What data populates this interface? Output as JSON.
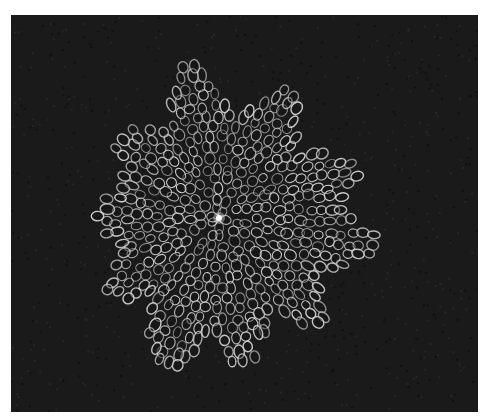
{
  "image": {
    "subject": "radial cellular colony (white cell outlines on dark background)",
    "caption": "",
    "frame_color": "#ffffff",
    "background_color": "#1a1a1a",
    "outline_color": "#d9d9d9",
    "center_highlight_color": "#ffffff",
    "panel": {
      "x": 11,
      "y": 15,
      "width": 467,
      "height": 397
    },
    "colony": {
      "center": {
        "x": 219,
        "y": 218
      },
      "base_radius": 95,
      "lobes": [
        {
          "angle_deg": -100,
          "reach": 160
        },
        {
          "angle_deg": -60,
          "reach": 150
        },
        {
          "angle_deg": -20,
          "reach": 150
        },
        {
          "angle_deg": 10,
          "reach": 165
        },
        {
          "angle_deg": 45,
          "reach": 145
        },
        {
          "angle_deg": 80,
          "reach": 150
        },
        {
          "angle_deg": 110,
          "reach": 165
        },
        {
          "angle_deg": 145,
          "reach": 135
        },
        {
          "angle_deg": 180,
          "reach": 125
        },
        {
          "angle_deg": -140,
          "reach": 130
        }
      ],
      "rings": 9,
      "cell_size": 11
    }
  }
}
